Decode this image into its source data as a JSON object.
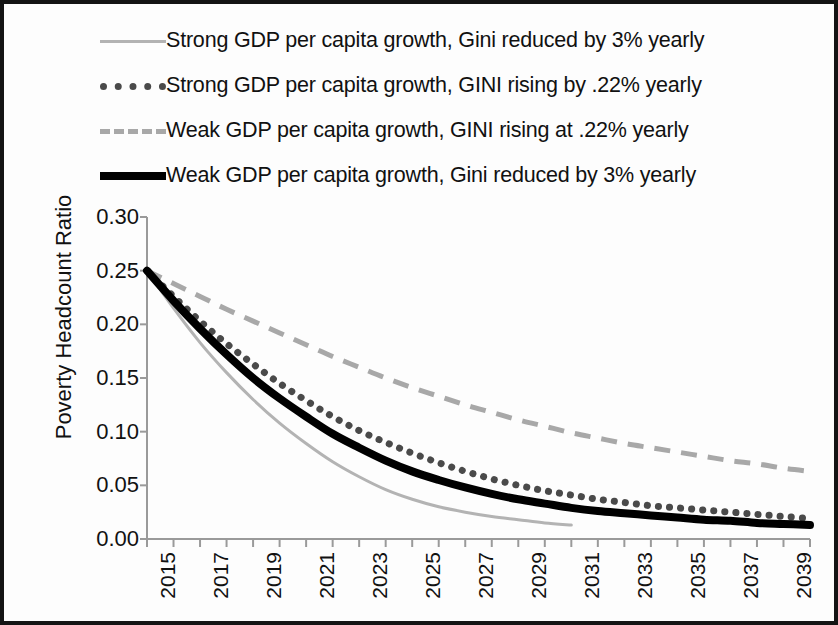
{
  "chart_data": {
    "type": "line",
    "title": "",
    "xlabel": "",
    "ylabel": "Poverty Headcount Ratio",
    "xlim": [
      2015,
      2040
    ],
    "ylim": [
      0.0,
      0.3
    ],
    "ytick_labels": [
      "0.30",
      "0.25",
      "0.20",
      "0.15",
      "0.10",
      "0.05",
      "0.00"
    ],
    "ytick_values": [
      0.3,
      0.25,
      0.2,
      0.15,
      0.1,
      0.05,
      0.0
    ],
    "xtick_labels": [
      "2015",
      "2017",
      "2019",
      "2021",
      "2023",
      "2025",
      "2027",
      "2029",
      "2031",
      "2033",
      "2035",
      "2037",
      "2039"
    ],
    "xtick_values": [
      2015,
      2017,
      2019,
      2021,
      2023,
      2025,
      2027,
      2029,
      2031,
      2033,
      2035,
      2037,
      2039
    ],
    "grid": false,
    "legend_position": "top",
    "x": [
      2015,
      2016,
      2017,
      2018,
      2019,
      2020,
      2021,
      2022,
      2023,
      2024,
      2025,
      2026,
      2027,
      2028,
      2029,
      2030,
      2031,
      2032,
      2033,
      2034,
      2035,
      2036,
      2037,
      2038,
      2039,
      2040
    ],
    "series": [
      {
        "name": "Strong GDP per capita growth, Gini reduced by 3% yearly",
        "style": "solid-thin-gray",
        "color": "#b3b3b3",
        "x": [
          2015,
          2016,
          2017,
          2018,
          2019,
          2020,
          2021,
          2022,
          2023,
          2024,
          2025,
          2026,
          2027,
          2028,
          2029,
          2030,
          2031
        ],
        "values": [
          0.25,
          0.215,
          0.183,
          0.155,
          0.13,
          0.108,
          0.089,
          0.072,
          0.058,
          0.046,
          0.037,
          0.03,
          0.025,
          0.021,
          0.018,
          0.015,
          0.013
        ]
      },
      {
        "name": "Strong GDP per capita growth, GINI rising by .22% yearly",
        "style": "dotted-dark",
        "color": "#4a4a4a",
        "x": [
          2015,
          2016,
          2017,
          2018,
          2019,
          2020,
          2021,
          2022,
          2023,
          2024,
          2025,
          2026,
          2027,
          2028,
          2029,
          2030,
          2031,
          2032,
          2033,
          2034,
          2035,
          2036,
          2037,
          2038,
          2039,
          2040
        ],
        "values": [
          0.25,
          0.226,
          0.203,
          0.182,
          0.163,
          0.145,
          0.129,
          0.114,
          0.101,
          0.09,
          0.08,
          0.071,
          0.063,
          0.056,
          0.05,
          0.045,
          0.041,
          0.037,
          0.034,
          0.031,
          0.029,
          0.027,
          0.025,
          0.023,
          0.021,
          0.019
        ]
      },
      {
        "name": "Weak GDP per capita growth, GINI rising at .22% yearly",
        "style": "dashed-gray",
        "color": "#a8a8a8",
        "x": [
          2015,
          2016,
          2017,
          2018,
          2019,
          2020,
          2021,
          2022,
          2023,
          2024,
          2025,
          2026,
          2027,
          2028,
          2029,
          2030,
          2031,
          2032,
          2033,
          2034,
          2035,
          2036,
          2037,
          2038,
          2039,
          2040
        ],
        "values": [
          0.25,
          0.238,
          0.226,
          0.214,
          0.203,
          0.192,
          0.181,
          0.17,
          0.16,
          0.15,
          0.141,
          0.133,
          0.125,
          0.118,
          0.111,
          0.105,
          0.099,
          0.094,
          0.089,
          0.085,
          0.081,
          0.077,
          0.073,
          0.07,
          0.066,
          0.063
        ]
      },
      {
        "name": "Weak GDP per capita growth, Gini reduced by 3% yearly",
        "style": "solid-thick-black",
        "color": "#000000",
        "x": [
          2015,
          2016,
          2017,
          2018,
          2019,
          2020,
          2021,
          2022,
          2023,
          2024,
          2025,
          2026,
          2027,
          2028,
          2029,
          2030,
          2031,
          2032,
          2033,
          2034,
          2035,
          2036,
          2037,
          2038,
          2039,
          2040
        ],
        "values": [
          0.25,
          0.222,
          0.196,
          0.172,
          0.15,
          0.131,
          0.114,
          0.098,
          0.085,
          0.073,
          0.063,
          0.055,
          0.048,
          0.042,
          0.037,
          0.033,
          0.029,
          0.026,
          0.024,
          0.022,
          0.02,
          0.018,
          0.017,
          0.015,
          0.014,
          0.013
        ]
      }
    ]
  },
  "legend": {
    "items": [
      {
        "label": "Strong GDP per capita growth, Gini reduced by 3% yearly",
        "key": "solid-thin-gray"
      },
      {
        "label": "Strong GDP per capita growth, GINI rising by .22% yearly",
        "key": "dotted-dark"
      },
      {
        "label": "Weak GDP per capita growth, GINI rising at .22% yearly",
        "key": "dashed-gray"
      },
      {
        "label": "Weak GDP per capita growth, Gini reduced by 3% yearly",
        "key": "solid-thick-black"
      }
    ]
  }
}
